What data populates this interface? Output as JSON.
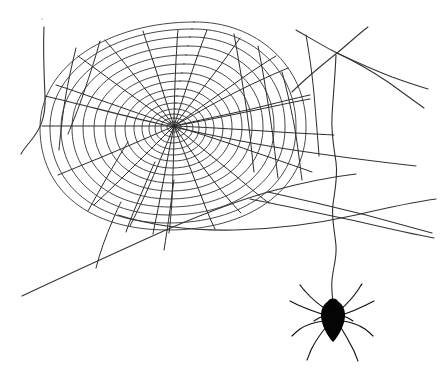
{
  "image": {
    "title": "Spider web with hanging spider",
    "type": "line-drawing",
    "width": 446,
    "height": 378,
    "background_color": "#ffffff",
    "line_color": "#2b2b2b",
    "spider_color": "#050505"
  },
  "web": {
    "hub": {
      "x": 174,
      "y": 126
    },
    "radial_count": 22,
    "spiral_ring_count": 20,
    "description": "Orb web occupying the upper-left two thirds of the frame, spun between anchor threads"
  },
  "spider": {
    "body_center": {
      "x": 333,
      "y": 318
    },
    "leg_count": 8,
    "drop_line_top": {
      "x": 335,
      "y": 53
    },
    "drop_line_bottom": {
      "x": 333,
      "y": 305
    }
  },
  "anchors": [
    {
      "name": "left-vertical-anchor"
    },
    {
      "name": "left-horizontal-anchor"
    },
    {
      "name": "lower-left-diagonal-anchor"
    },
    {
      "name": "right-upper-crossing-anchor"
    },
    {
      "name": "right-mid-anchor"
    },
    {
      "name": "right-lower-anchor"
    },
    {
      "name": "bottom-sweep-anchor"
    }
  ]
}
